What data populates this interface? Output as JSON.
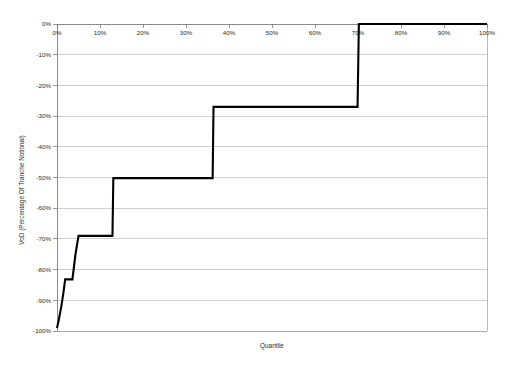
{
  "chart_data": {
    "type": "line",
    "title": "",
    "subtitle": "",
    "xlabel": "Quantile",
    "ylabel": "VoD (Percentage Of Tranche Notional)",
    "xlim": [
      0,
      100
    ],
    "ylim": [
      -100,
      0
    ],
    "grid": true,
    "grid_axis": "y",
    "legend": "none",
    "x_tick_labels": [
      "0%",
      "10%",
      "20%",
      "30%",
      "40%",
      "50%",
      "60%",
      "70%",
      "80%",
      "90%",
      "100%"
    ],
    "x_tick_values": [
      0,
      10,
      20,
      30,
      40,
      50,
      60,
      70,
      80,
      90,
      100
    ],
    "y_tick_labels": [
      "0%",
      "-10%",
      "-20%",
      "-30%",
      "-40%",
      "-50%",
      "-60%",
      "-70%",
      "-80%",
      "-90%",
      "-100%"
    ],
    "y_tick_values": [
      0,
      -10,
      -20,
      -30,
      -40,
      -50,
      -60,
      -70,
      -80,
      -90,
      -100
    ],
    "x_axis_position": "top",
    "series": [
      {
        "name": "VoD step function",
        "line_color": "#000000",
        "line_width": 2.1,
        "step": "post",
        "x": [
          0.0,
          0.4,
          1.0,
          1.5,
          1.9,
          1.9,
          3.6,
          3.6,
          4.3,
          5.0,
          5.0,
          12.9,
          12.9,
          13.1,
          36.2,
          36.2,
          36.4,
          69.9,
          69.9,
          70.2,
          100.0
        ],
        "y": [
          -99.0,
          -96.5,
          -92.0,
          -87.5,
          -83.2,
          -83.2,
          -83.2,
          -83.0,
          -75.0,
          -69.0,
          -69.0,
          -69.0,
          -68.8,
          -50.2,
          -50.2,
          -50.0,
          -27.0,
          -27.0,
          -26.8,
          0.0,
          0.0
        ]
      }
    ],
    "annotations": [],
    "plateaus": [
      {
        "label": "first plateau",
        "y": -83.2,
        "x_start": 1.9,
        "x_end": 3.6
      },
      {
        "label": "second plateau",
        "y": -69.0,
        "x_start": 5.0,
        "x_end": 12.9
      },
      {
        "label": "third plateau",
        "y": -50.2,
        "x_start": 13.1,
        "x_end": 36.2
      },
      {
        "label": "fourth plateau",
        "y": -27.0,
        "x_start": 36.4,
        "x_end": 69.9
      },
      {
        "label": "top plateau",
        "y": 0.0,
        "x_start": 70.2,
        "x_end": 100.0
      }
    ]
  }
}
